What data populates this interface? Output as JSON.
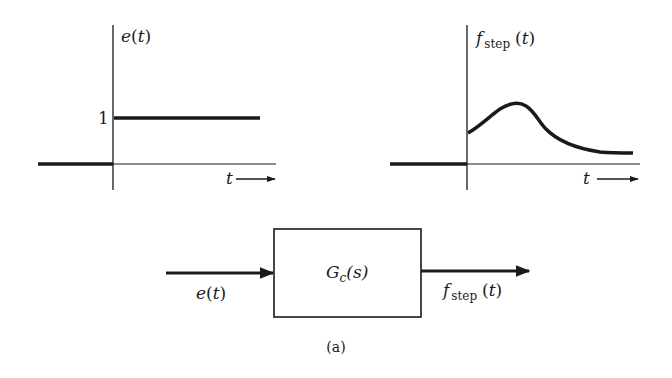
{
  "figure": {
    "caption": "(a)",
    "input_plot": {
      "y_label_var": "e",
      "y_label_paren_open": "(",
      "y_label_arg": "t",
      "y_label_paren_close": ")",
      "step_level_label": "1",
      "x_label": "t"
    },
    "output_plot": {
      "y_label_var": "f",
      "y_label_sub": "step",
      "y_label_paren_open": "(",
      "y_label_arg": "t",
      "y_label_paren_close": ")",
      "x_label": "t"
    },
    "block": {
      "transfer_var": "G",
      "transfer_sub": "c",
      "transfer_arg": "(s)",
      "input_var": "e",
      "input_arg_open": "(",
      "input_arg": "t",
      "input_arg_close": ")",
      "output_var": "f",
      "output_sub": "step",
      "output_arg_open": "(",
      "output_arg": "t",
      "output_arg_close": ")"
    },
    "colors": {
      "ink": "#1a1a1a",
      "background": "#ffffff"
    }
  }
}
